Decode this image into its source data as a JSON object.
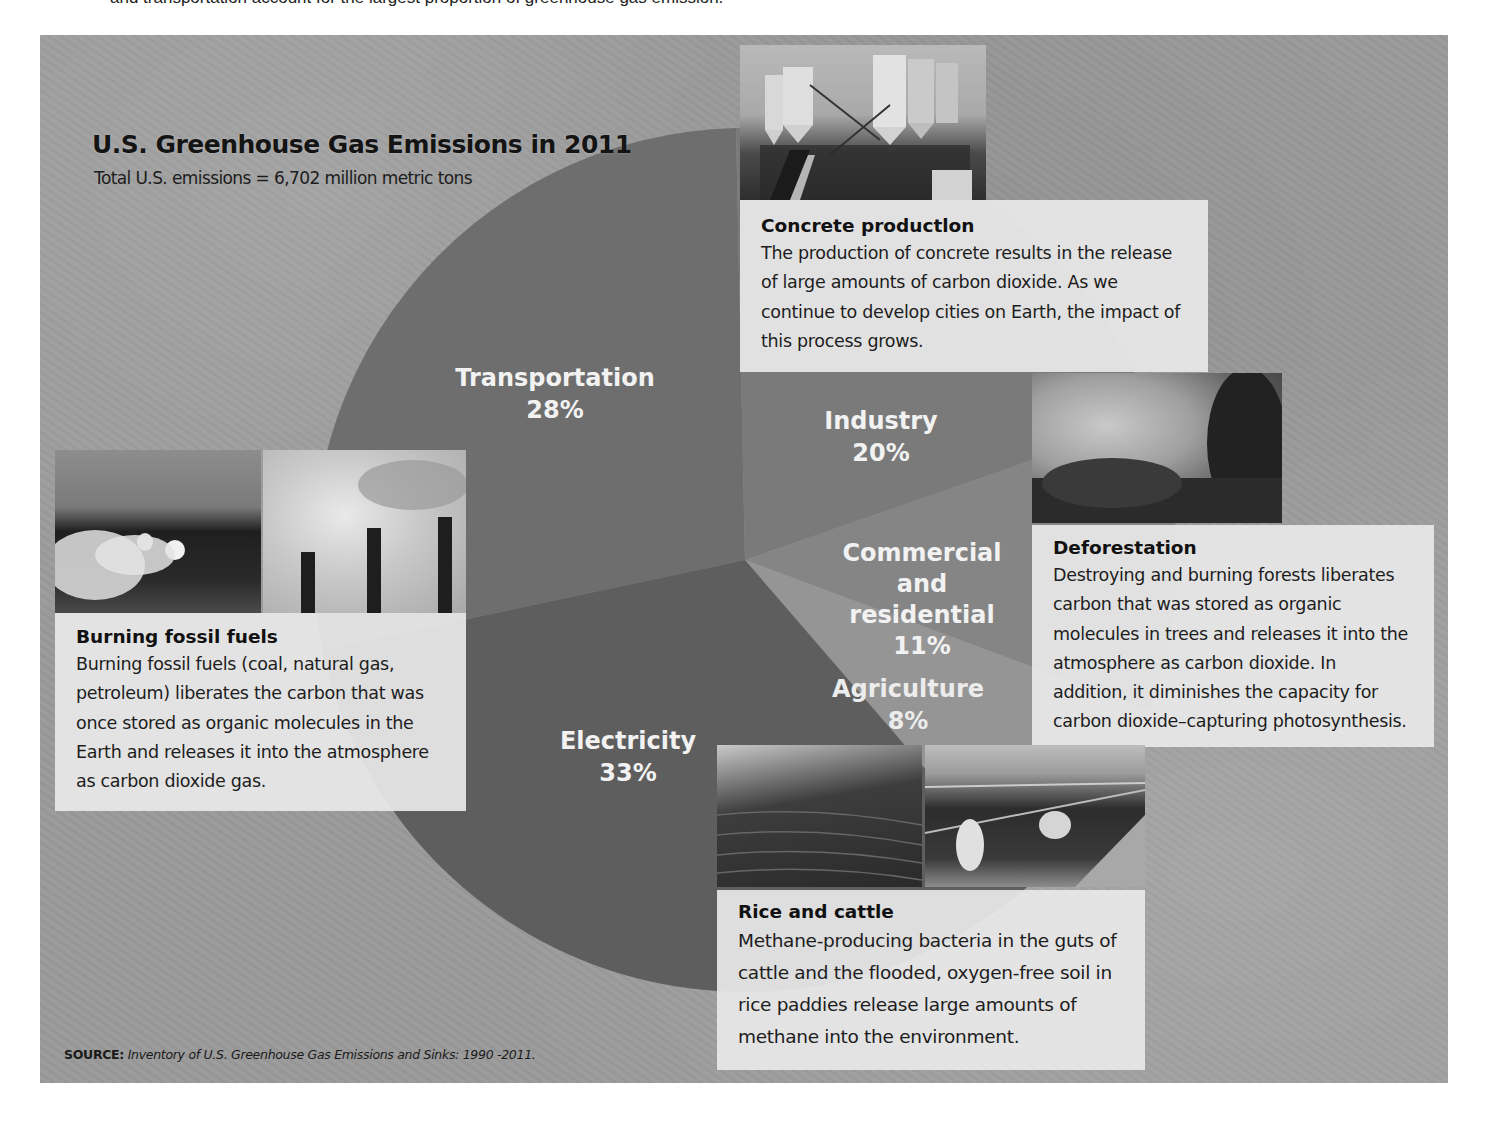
{
  "intro_text": "and transportation account for the largest proportion of greenhouse gas emission.",
  "header": {
    "title": "U.S. Greenhouse Gas Emissions in 2011",
    "subtitle": "Total U.S. emissions = 6,702 million metric tons"
  },
  "slices": [
    {
      "label": "Transportation",
      "percent": "28%"
    },
    {
      "label": "Industry",
      "percent": "20%"
    },
    {
      "label_line1": "Commercial and",
      "label_line2": "residential",
      "percent": "11%"
    },
    {
      "label": "Agriculture",
      "percent": "8%"
    },
    {
      "label": "Electricity",
      "percent": "33%"
    }
  ],
  "cards": {
    "concrete": {
      "heading": "Concrete productlon",
      "body": "The production of concrete results in the release of large amounts of carbon dioxide. As we continue to develop cities on Earth, the impact of this process grows."
    },
    "deforestation": {
      "heading": "Deforestation",
      "body": "Destroying and burning forests liberates carbon that was stored as organic molecules in trees and releases it into the atmosphere as carbon dioxide. In addition, it diminishes the capacity for carbon dioxide–capturing photosynthesis."
    },
    "fossil": {
      "heading": "Burning fossil fuels",
      "body": "Burning fossil fuels (coal, natural gas, petroleum) liberates the carbon that was once stored as organic molecules in the Earth and releases it into the atmosphere as carbon dioxide gas."
    },
    "rice": {
      "heading": "Rice and cattle",
      "body": "Methane-producing bacteria in the guts of cattle and the flooded, oxygen-free soil in rice paddies release large amounts of methane into the environment."
    }
  },
  "photos": {
    "concrete": "concrete-plant-photo",
    "deforestation": "burning-forest-photo",
    "fossil_car": "car-exhaust-photo",
    "fossil_stacks": "smokestacks-photo",
    "rice": "rice-terraces-photo",
    "cattle": "cattle-feedlot-photo"
  },
  "source": {
    "label": "SOURCE:",
    "text": "Inventory of U.S. Greenhouse Gas Emissions and Sinks: 1990 -2011."
  },
  "colors": {
    "background": "#9a9a9a",
    "transportation": "#6e6e6e",
    "industry": "#7a7a7a",
    "commercial": "#858585",
    "agriculture": "#959595",
    "electricity": "#5e5e5e",
    "card": "#e8e8e8"
  },
  "chart_data": {
    "type": "pie",
    "title": "U.S. Greenhouse Gas Emissions in 2011",
    "subtitle": "Total U.S. emissions = 6,702 million metric tons",
    "categories": [
      "Transportation",
      "Industry",
      "Commercial and residential",
      "Agriculture",
      "Electricity"
    ],
    "values": [
      28,
      20,
      11,
      8,
      33
    ],
    "unit": "%",
    "annotations": [
      "Concrete production",
      "Deforestation",
      "Burning fossil fuels",
      "Rice and cattle"
    ],
    "source": "Inventory of U.S. Greenhouse Gas Emissions and Sinks: 1990 -2011."
  }
}
